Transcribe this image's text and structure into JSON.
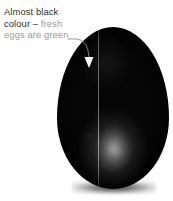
{
  "figure": {
    "background_color": "#ffffff",
    "width_px": 173,
    "height_px": 201
  },
  "annotation": {
    "lines": [
      {
        "text": "Almost black",
        "color": "#2d2d2d",
        "emphasis": "dark"
      },
      {
        "text": "colour – fresh",
        "color": "#2d2d2d",
        "emphasis": "dark"
      },
      {
        "text": "eggs are green",
        "color": "#9a9a9a",
        "emphasis": "grey"
      }
    ],
    "line1": "Almost black",
    "line2_dark": "colour – ",
    "line2_grey": "fresh",
    "line3": "eggs are green",
    "full_text": "Almost black colour – fresh eggs are green",
    "leader": {
      "name": "curved-leader-line",
      "color": "#8c8c8c",
      "arrowhead_color": "#ffffff",
      "arrowhead_direction": "down"
    }
  },
  "subject": {
    "name": "egg",
    "description": "Almost black egg shown upright",
    "body_color": "#060606",
    "seam_highlight_color": "#ffffff",
    "shadow_color": "#000000"
  }
}
